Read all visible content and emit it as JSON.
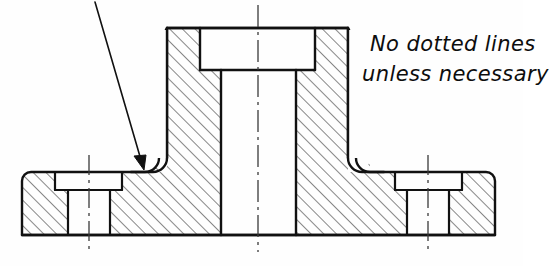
{
  "drawing": {
    "title": "Sectional view of flanged hub",
    "annotation": {
      "line1": "No dotted lines",
      "line2": "unless necessary"
    },
    "style": {
      "line_color": "#111111",
      "hatch_color": "#1a1a1a",
      "centerline_color": "#444444",
      "background": "#fefefe",
      "outline_width": 2.4,
      "hatch_width": 1.0,
      "centerline_width": 1.2,
      "hatch_angle_deg": 45,
      "hatch_spacing_px": 9
    },
    "geometry": {
      "base_plate": {
        "left_x": 22,
        "right_x": 495,
        "top_y": 172,
        "bottom_y": 235,
        "corner_radius": 9
      },
      "central_boss": {
        "outer_left_x": 167,
        "outer_right_x": 348,
        "top_y": 28,
        "fillet_radius": 14
      },
      "counterbore": {
        "left_x": 200,
        "right_x": 315,
        "floor_y": 70
      },
      "through_bore": {
        "left_x": 221,
        "right_x": 296,
        "bottom_y": 235
      },
      "bolt_hole_left": {
        "cbore_left_x": 55,
        "cbore_right_x": 122,
        "cbore_top_y": 176,
        "cbore_floor_y": 190,
        "bore_left_x": 68,
        "bore_right_x": 110,
        "centerline_x": 89
      },
      "bolt_hole_right": {
        "cbore_left_x": 395,
        "cbore_right_x": 462,
        "cbore_top_y": 176,
        "cbore_floor_y": 190,
        "bore_left_x": 407,
        "bore_right_x": 449,
        "centerline_x": 428
      },
      "main_centerline": {
        "x": 258,
        "top_y": 5,
        "bottom_y": 252
      },
      "leader": {
        "start_x": 95,
        "start_y": 2,
        "end_x": 145,
        "end_y": 167,
        "arrow_size": 13
      }
    },
    "labels": {
      "main_centerline": "main-centerline",
      "left_hole_centerline": "left-hole-centerline",
      "right_hole_centerline": "right-hole-centerline",
      "leader_arrow": "fillet-leader-arrow"
    }
  }
}
